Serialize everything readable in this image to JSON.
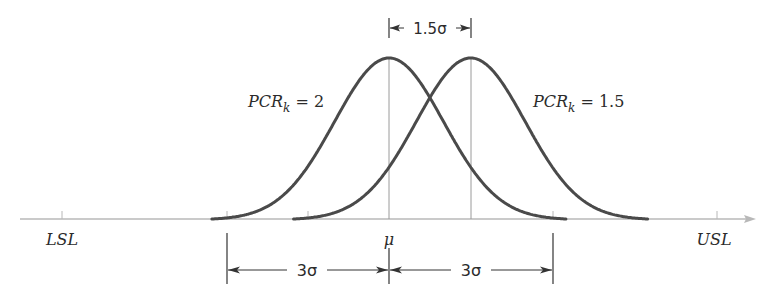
{
  "figure": {
    "title": "",
    "axis": {
      "y": 219,
      "x_start": 20,
      "x_end": 756,
      "color": "#b8b8b8"
    },
    "curve_color": "#4a4a4a",
    "guide_color": "#9a9a9a",
    "dim_color": "#333333"
  },
  "labels": {
    "lsl": "LSL",
    "usl": "USL",
    "mu": "μ",
    "curve1_main": "PCR",
    "curve1_sub": "k",
    "curve1_value": " = 2",
    "curve2_main": "PCR",
    "curve2_sub": "k",
    "curve2_value": " = 1.5",
    "shift": "1.5σ",
    "left_span": "3σ",
    "right_span": "3σ"
  },
  "chart_data": {
    "type": "line",
    "title": "",
    "xlabel": "",
    "ylabel": "",
    "grid": false,
    "legend": "none (inline labels)",
    "x_ticks": [
      "LSL",
      "μ",
      "USL"
    ],
    "series": [
      {
        "name": "PCR_k = 2",
        "distribution": "normal",
        "mean": "μ",
        "sigma_units": 1,
        "center_offset_sigma": 0
      },
      {
        "name": "PCR_k = 1.5",
        "distribution": "normal",
        "mean": "μ + 1.5σ",
        "sigma_units": 1,
        "center_offset_sigma": 1.5
      }
    ],
    "annotations": [
      {
        "text": "1.5σ",
        "from": "μ",
        "to": "μ + 1.5σ",
        "position": "top"
      },
      {
        "text": "3σ",
        "from": "μ - 3σ",
        "to": "μ",
        "position": "bottom"
      },
      {
        "text": "3σ",
        "from": "μ",
        "to": "μ + 3σ",
        "position": "bottom"
      },
      {
        "text": "LSL",
        "at": "μ - 6σ"
      },
      {
        "text": "USL",
        "at": "μ + 6σ"
      }
    ]
  }
}
